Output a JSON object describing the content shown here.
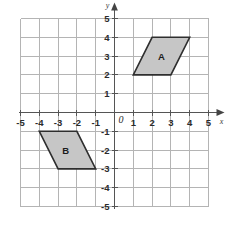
{
  "chart_data": {
    "type": "scatter",
    "title": "",
    "xlabel": "x",
    "ylabel": "y",
    "xlim": [
      -5,
      5
    ],
    "ylim": [
      -5,
      5
    ],
    "grid": true,
    "legend": "none",
    "x_tick_labels": [
      "-5",
      "-4",
      "-3",
      "-2",
      "-1",
      "1",
      "2",
      "3",
      "4",
      "5"
    ],
    "y_tick_labels": [
      "5",
      "4",
      "3",
      "2",
      "1",
      "-1",
      "-2",
      "-3",
      "-4",
      "-5"
    ],
    "x_ticks": [
      -5,
      -4,
      -3,
      -2,
      -1,
      1,
      2,
      3,
      4,
      5
    ],
    "y_ticks": [
      5,
      4,
      3,
      2,
      1,
      -1,
      -2,
      -3,
      -4,
      -5
    ],
    "origin_label": "0",
    "shapes": [
      {
        "label": "A",
        "kind": "parallelogram",
        "vertices": [
          [
            1,
            2
          ],
          [
            3,
            2
          ],
          [
            4,
            4
          ],
          [
            2,
            4
          ]
        ],
        "label_position": [
          2.5,
          3
        ],
        "fill": "#c6c6c6",
        "stroke": "#2e2e2e"
      },
      {
        "label": "B",
        "kind": "parallelogram",
        "vertices": [
          [
            -4,
            -1
          ],
          [
            -2,
            -1
          ],
          [
            -1,
            -3
          ],
          [
            -3,
            -3
          ]
        ],
        "label_position": [
          -2.6,
          -2
        ],
        "fill": "#c6c6c6",
        "stroke": "#2e2e2e"
      }
    ]
  },
  "axes": {
    "x_axis_name": "x",
    "y_axis_name": "y"
  },
  "colors": {
    "grid": "#b4b4b4",
    "axis": "#555555",
    "shape_fill": "#c6c6c6",
    "shape_stroke": "#2e2e2e",
    "background": "#ffffff"
  }
}
